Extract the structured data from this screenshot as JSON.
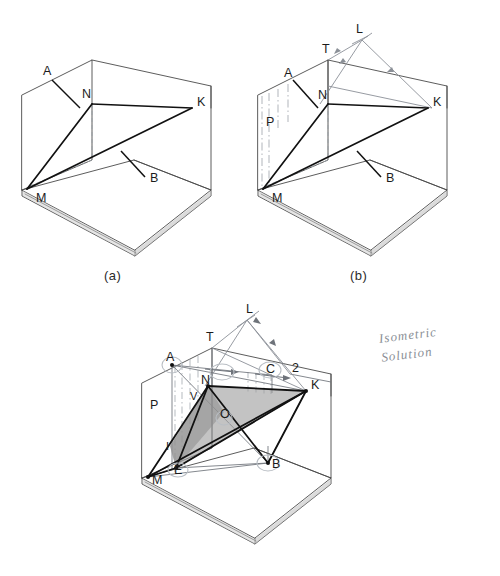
{
  "page": {
    "background": "#ffffff",
    "ink": "#1c1c1c",
    "thin_ink": "#5a5a5a",
    "faint_ink": "#9aa0a6",
    "shade_fill": "#9a9a9a",
    "shade_fill_light": "#b4b4b4",
    "width": 500,
    "height": 576
  },
  "annotation": {
    "handwritten_note_line1": "Isometric",
    "handwritten_note_line2": "Solution",
    "color": "#8a8f96"
  },
  "figures": [
    {
      "id": "fig-a",
      "caption": "(a)",
      "caption_x": 104,
      "caption_y": 268,
      "description": "Isometric view of vertical wall and horizontal floor with triangle M-N-K and leader labels A and B",
      "vertex_labels": [
        {
          "name": "A",
          "text": "A",
          "x": 43,
          "y": 75
        },
        {
          "name": "N",
          "text": "N",
          "x": 82,
          "y": 98
        },
        {
          "name": "K",
          "text": "K",
          "x": 197,
          "y": 106
        },
        {
          "name": "M",
          "text": "M",
          "x": 36,
          "y": 202
        },
        {
          "name": "B",
          "text": "B",
          "x": 150,
          "y": 182
        }
      ]
    },
    {
      "id": "fig-b",
      "caption": "(b)",
      "caption_x": 350,
      "caption_y": 268,
      "description": "Same solid with light source L, point T on top edge, light-ray arrows and auxiliary plane P on the wall",
      "vertex_labels": [
        {
          "name": "L",
          "text": "L",
          "x": 356,
          "y": 33
        },
        {
          "name": "T",
          "text": "T",
          "x": 326,
          "y": 53
        },
        {
          "name": "A",
          "text": "A",
          "x": 284,
          "y": 77
        },
        {
          "name": "N",
          "text": "N",
          "x": 320,
          "y": 99
        },
        {
          "name": "K",
          "text": "K",
          "x": 435,
          "y": 108
        },
        {
          "name": "P",
          "text": "P",
          "x": 268,
          "y": 124
        },
        {
          "name": "M",
          "text": "M",
          "x": 274,
          "y": 202
        },
        {
          "name": "B",
          "text": "B",
          "x": 386,
          "y": 182
        }
      ]
    },
    {
      "id": "fig-c",
      "caption": "",
      "description": "Completed isometric solution: shaded shadow polygon N-O-K-E-I with construction points A, C, 2, V, O, I, E, B, T, L and trace plane P",
      "vertex_labels": [
        {
          "name": "L",
          "text": "L",
          "x": 250,
          "y": 312
        },
        {
          "name": "T",
          "text": "T",
          "x": 208,
          "y": 335
        },
        {
          "name": "A",
          "text": "A",
          "x": 167,
          "y": 360
        },
        {
          "name": "C",
          "text": "C",
          "x": 269,
          "y": 368
        },
        {
          "name": "2",
          "text": "2",
          "x": 293,
          "y": 367
        },
        {
          "name": "N",
          "text": "N",
          "x": 205,
          "y": 380
        },
        {
          "name": "K",
          "text": "K",
          "x": 314,
          "y": 388
        },
        {
          "name": "P",
          "text": "P",
          "x": 152,
          "y": 407
        },
        {
          "name": "V",
          "text": "V",
          "x": 192,
          "y": 398
        },
        {
          "name": "O",
          "text": "O",
          "x": 225,
          "y": 414
        },
        {
          "name": "I",
          "text": "I",
          "x": 167,
          "y": 447
        },
        {
          "name": "E",
          "text": "E",
          "x": 178,
          "y": 470
        },
        {
          "name": "M",
          "text": "M",
          "x": 157,
          "y": 478
        },
        {
          "name": "B",
          "text": "B",
          "x": 274,
          "y": 468
        }
      ]
    }
  ]
}
